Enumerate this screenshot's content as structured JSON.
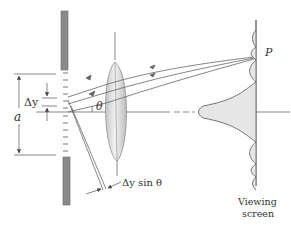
{
  "figure": {
    "labels": {
      "point": "P",
      "angle": "θ",
      "slit_width": "a",
      "element_width": "Δy",
      "path_difference": "Δy sin θ",
      "screen_line1": "Viewing",
      "screen_line2": "screen"
    },
    "colors": {
      "barrier": "#8a8a8a",
      "lines": "#555555",
      "lens_fill": "#d8d8d8",
      "pattern_fill": "#e6e6e6",
      "text": "#333333"
    }
  }
}
